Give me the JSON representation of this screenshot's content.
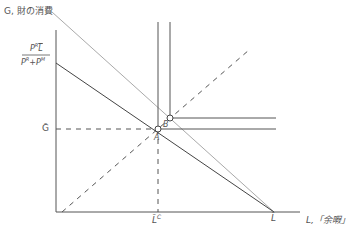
{
  "diagram": {
    "y_axis_label": "G, 財の消費",
    "x_axis_label": "L,「余暇」",
    "y_intercept_label": {
      "numerator": "P^R L̄",
      "denominator": "P^R + P^M",
      "num_main": "P",
      "num_sup": "R",
      "num_bar": "L",
      "den_a": "P",
      "den_a_sup": "R",
      "den_plus": "+",
      "den_b": "P",
      "den_b_sup": "M"
    },
    "g_bar_label": "Ḡ",
    "lc_label": "L̄",
    "lc_sup": "C",
    "l_bar_label": "L̄",
    "point_a": "A",
    "point_b": "B"
  }
}
